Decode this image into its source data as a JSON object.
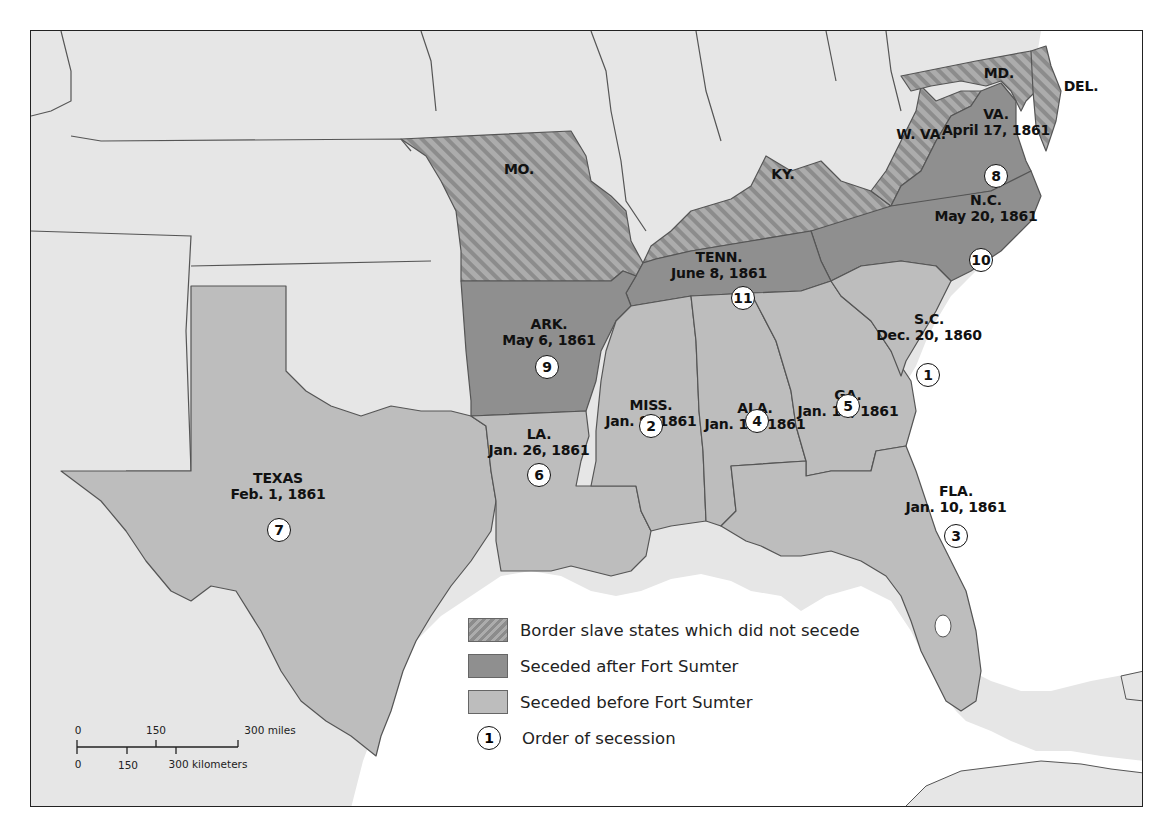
{
  "map": {
    "title": "Secession of Southern States",
    "colors": {
      "background_states": "#e6e6e6",
      "seceded_before": "#bdbdbd",
      "seceded_after": "#8f8f8f",
      "border_states": "#aaaaaa",
      "border_hatch": "#8a8a8a",
      "water": "#ffffff",
      "frame": "#222222"
    },
    "states": [
      {
        "abbr": "S.C.",
        "date": "Dec. 20, 1860",
        "order": "1",
        "category": "seceded_before"
      },
      {
        "abbr": "MISS.",
        "date": "Jan. 9, 1861",
        "order": "2",
        "category": "seceded_before"
      },
      {
        "abbr": "FLA.",
        "date": "Jan. 10, 1861",
        "order": "3",
        "category": "seceded_before"
      },
      {
        "abbr": "ALA.",
        "date": "Jan. 11, 1861",
        "order": "4",
        "category": "seceded_before"
      },
      {
        "abbr": "GA.",
        "date": "Jan. 19, 1861",
        "order": "5",
        "category": "seceded_before"
      },
      {
        "abbr": "LA.",
        "date": "Jan. 26, 1861",
        "order": "6",
        "category": "seceded_before"
      },
      {
        "abbr": "TEXAS",
        "date": "Feb. 1, 1861",
        "order": "7",
        "category": "seceded_before"
      },
      {
        "abbr": "VA.",
        "date": "April 17, 1861",
        "order": "8",
        "category": "seceded_after"
      },
      {
        "abbr": "ARK.",
        "date": "May 6, 1861",
        "order": "9",
        "category": "seceded_after"
      },
      {
        "abbr": "N.C.",
        "date": "May 20, 1861",
        "order": "10",
        "category": "seceded_after"
      },
      {
        "abbr": "TENN.",
        "date": "June 8, 1861",
        "order": "11",
        "category": "seceded_after"
      }
    ],
    "border_states": [
      {
        "abbr": "MO."
      },
      {
        "abbr": "KY."
      },
      {
        "abbr": "W. VA."
      },
      {
        "abbr": "MD."
      },
      {
        "abbr": "DEL."
      }
    ]
  },
  "legend": {
    "items": [
      {
        "label": "Border slave states which did not secede",
        "type": "hatched"
      },
      {
        "label": "Seceded after Fort Sumter",
        "type": "dark"
      },
      {
        "label": "Seceded before Fort Sumter",
        "type": "light"
      },
      {
        "label": "Order of secession",
        "type": "circle",
        "symbol": "1"
      }
    ]
  },
  "scale_bar": {
    "miles": {
      "ticks": [
        "0",
        "150",
        "300 miles"
      ]
    },
    "kilometers": {
      "ticks": [
        "0",
        "150",
        "300 kilometers"
      ]
    }
  }
}
